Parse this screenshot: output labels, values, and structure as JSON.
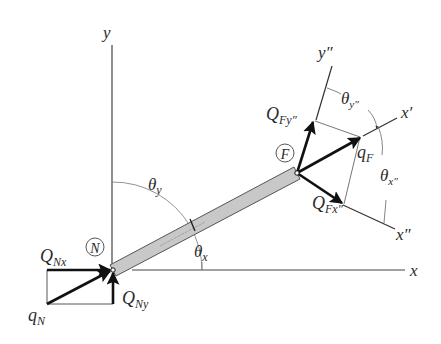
{
  "figure": {
    "nodes": {
      "N": {
        "label": "N",
        "x": 113,
        "y": 270
      },
      "F": {
        "label": "F",
        "x": 297,
        "y": 173
      }
    },
    "axes": {
      "global_x": {
        "label": "x"
      },
      "global_y": {
        "label": "y"
      },
      "local_x_prime": {
        "label": "x′"
      },
      "rotated_x_double_prime": {
        "label": "x″"
      },
      "rotated_y_double_prime": {
        "label": "y″"
      }
    },
    "angles": {
      "theta_x": {
        "symbol": "θ",
        "subscript": "x"
      },
      "theta_y": {
        "symbol": "θ",
        "subscript": "y"
      },
      "theta_x_double_prime": {
        "symbol": "θ",
        "subscript": "x″"
      },
      "theta_y_double_prime": {
        "symbol": "θ",
        "subscript": "y″"
      }
    },
    "forces": {
      "q_N": {
        "symbol": "q",
        "subscript": "N"
      },
      "Q_Nx": {
        "symbol": "Q",
        "subscript": "Nx"
      },
      "Q_Ny": {
        "symbol": "Q",
        "subscript": "Ny"
      },
      "q_F": {
        "symbol": "q",
        "subscript": "F"
      },
      "Q_Fx2": {
        "symbol": "Q",
        "subscript": "Fx″"
      },
      "Q_Fy2": {
        "symbol": "Q",
        "subscript": "Fy″"
      }
    },
    "colors": {
      "bar_fill": "#c8c8c8",
      "bar_edge": "#555555",
      "line": "#333333",
      "arrow": "#111111",
      "thin": "#666666"
    }
  }
}
